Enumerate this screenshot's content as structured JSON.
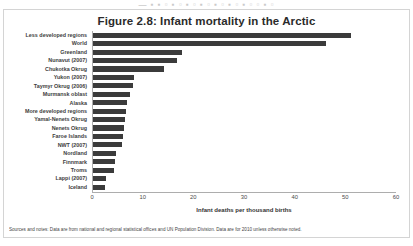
{
  "artifact": {
    "top_strip_text": "— ▪ ▪ ▫ ▪ ▫ ▪ ▫ ▪ ▫ ▪ ▫ ▪ ▫ ▪ ▫ ▫ ▪ ▫"
  },
  "figure": {
    "title": "Figure 2.8: Infant mortality in the Arctic",
    "source_note": "Sources and notes: Data are from national and regional statistical offices and UN Population Division. Data are for 2010 unless otherwise noted.",
    "bar_color": "#3b3b3b",
    "axis_color": "#adadad"
  },
  "chart_data": {
    "type": "bar",
    "orientation": "horizontal",
    "title": "Figure 2.8: Infant mortality in the Arctic",
    "xlabel": "Infant deaths per thousand births",
    "ylabel": "",
    "xlim": [
      0,
      60
    ],
    "xticks": [
      0,
      10,
      20,
      30,
      40,
      50,
      60
    ],
    "grid": false,
    "legend": false,
    "categories": [
      "Less developed regions",
      "World",
      "Greenland",
      "Nunavut (2007)",
      "Chukotka Okrug",
      "Yukon (2007)",
      "Taymyr Okrug (2006)",
      "Murmansk oblast",
      "Alaska",
      "More developed regions",
      "Yamal-Nenets Okrug",
      "Nenets Okrug",
      "Faroe Islands",
      "NWT (2007)",
      "Nordland",
      "Finnmark",
      "Troms",
      "Lappi (2007)",
      "Iceland"
    ],
    "values": [
      51.0,
      46.0,
      17.5,
      16.5,
      14.0,
      8.0,
      7.8,
      7.3,
      6.8,
      6.6,
      6.4,
      6.2,
      5.9,
      5.7,
      4.6,
      4.4,
      4.2,
      2.6,
      2.4
    ]
  }
}
